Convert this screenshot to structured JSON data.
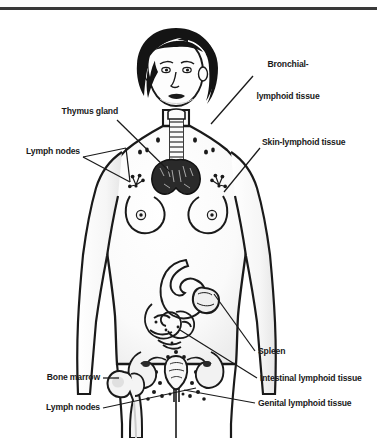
{
  "figure": {
    "title_rule": true,
    "colors": {
      "ink": "#1a1a1a",
      "rule": "#3a3a3a",
      "background": "#ffffff",
      "shading": "#e8e8e8",
      "hair": "#141414"
    }
  },
  "labels": {
    "bronchial": {
      "line1": "Bronchial-",
      "line2": "lymphoid tissue"
    },
    "thymus": "Thymus gland",
    "lymph_nodes_upper": "Lymph nodes",
    "skin": "Skin-lymphoid tissue",
    "spleen": "Spleen",
    "intestinal": "Intestinal lymphoid tissue",
    "genital": "Genital lymphoid tissue",
    "bone_marrow": "Bone marrow",
    "lymph_nodes_lower": "Lymph nodes"
  }
}
